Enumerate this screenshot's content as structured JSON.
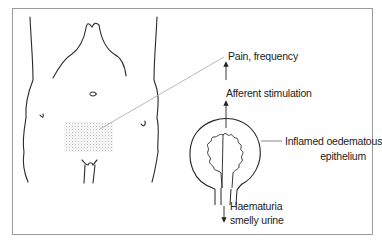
{
  "figure": {
    "labels": {
      "pain": "Pain, frequency",
      "afferent": "Afferent stimulation",
      "inflamed_line1": "Inflamed oedematous",
      "inflamed_line2": "epithelium",
      "haematuria_line1": "Haematuria",
      "haematuria_line2": "smelly urine"
    },
    "colors": {
      "line": "#2a2a2a",
      "frame": "#9a9a9a",
      "pointer": "#b0b0b0",
      "stipple": "#bdbdbd"
    }
  }
}
